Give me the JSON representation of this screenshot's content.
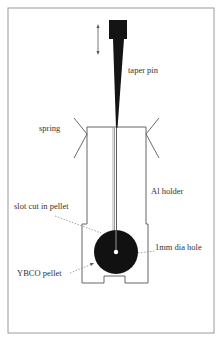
{
  "diagram": {
    "labels": {
      "taper_pin": "taper pin",
      "spring": "spring",
      "al_holder": "Al holder",
      "slot_cut": "slot cut in pellet",
      "hole": "1mm dia hole",
      "pellet": "YBCO pellet"
    },
    "icons": {
      "motion_arrow": "double-headed vertical arrow"
    },
    "colors": {
      "ink": "#111111",
      "line": "#555555",
      "frame": "#999999",
      "background": "#ffffff"
    }
  }
}
